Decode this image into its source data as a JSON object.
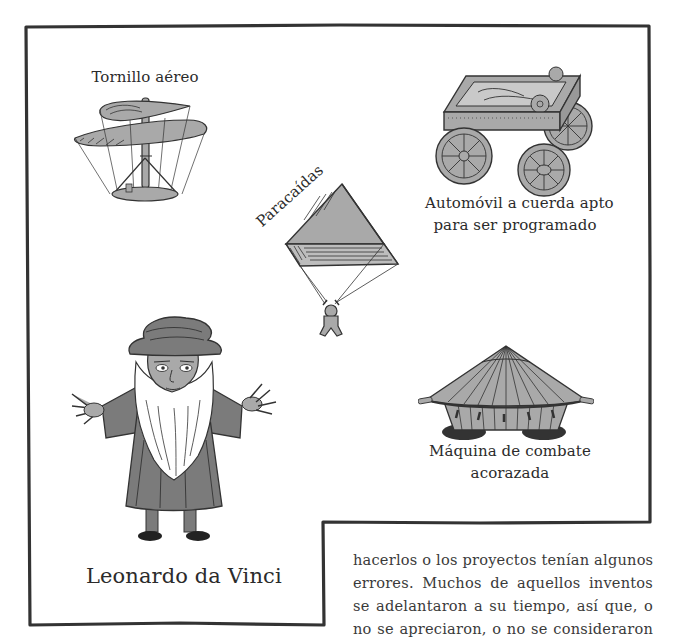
{
  "illustrations": {
    "helicopter": {
      "label": "Tornillo aéreo",
      "icon": "aerial-screw-icon"
    },
    "parachute": {
      "label": "Paracaídas",
      "icon": "parachute-icon"
    },
    "car": {
      "label_line1": "Automóvil a cuerda apto",
      "label_line2": "para ser programado",
      "icon": "self-propelled-cart-icon"
    },
    "tank": {
      "label_line1": "Máquina de combate",
      "label_line2": "acorazada",
      "icon": "armored-tank-icon"
    },
    "leonardo": {
      "label": "Leonardo da Vinci",
      "icon": "leonardo-portrait-icon"
    }
  },
  "paragraph": {
    "lines": [
      "hacerlos o los proyectos tenían algunos",
      "errores. Muchos de aquellos inventos",
      "se adelantaron a su tiempo, así que, o",
      "no se apreciaron, o no se consideraron"
    ]
  },
  "colors": {
    "ink": "#2b2b2b",
    "light_grey": "#a9a9a9",
    "mid_grey": "#7b7b7b",
    "background": "#ffffff"
  }
}
